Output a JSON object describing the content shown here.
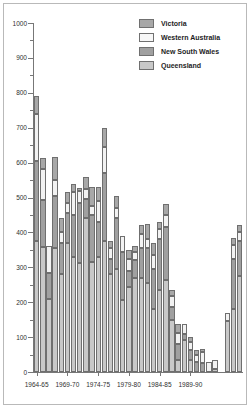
{
  "chart_data": {
    "type": "bar",
    "subtype": "stacked-vertical",
    "title": "",
    "xlabel": "",
    "ylabel": "",
    "ylim": [
      0,
      1000
    ],
    "ytick_step": 100,
    "yticks": [
      0,
      100,
      200,
      300,
      400,
      500,
      600,
      700,
      800,
      900,
      1000
    ],
    "ytick_labels": [
      "0",
      "100",
      "200",
      "300",
      "400",
      "500",
      "600",
      "700",
      "800",
      "900",
      "1000"
    ],
    "minor_ytick_step": 50,
    "grid": false,
    "legend_position": "top-right",
    "stack_order_bottom_to_top": [
      "Queensland",
      "New South Wales",
      "Western Australia",
      "Victoria"
    ],
    "series": [
      {
        "name": "Victoria",
        "color": "#a8a8a8",
        "values": [
          50,
          30,
          0,
          65,
          40,
          30,
          25,
          10,
          35,
          55,
          40,
          55,
          20,
          35,
          0,
          25,
          15,
          25,
          45,
          35,
          20,
          30,
          18,
          25,
          0,
          15,
          12,
          8,
          0,
          0,
          0,
          0,
          20,
          20
        ]
      },
      {
        "name": "Western Australia",
        "color": "#f2f2f2",
        "values": [
          135,
          90,
          78,
          45,
          30,
          30,
          65,
          35,
          30,
          25,
          60,
          75,
          30,
          30,
          45,
          35,
          25,
          40,
          25,
          40,
          30,
          35,
          32,
          33,
          28,
          22,
          20,
          33,
          30,
          25,
          0,
          23,
          40,
          25
        ]
      },
      {
        "name": "New South Wales",
        "color": "#a0a0a0",
        "values": [
          230,
          135,
          75,
          150,
          90,
          85,
          120,
          170,
          55,
          135,
          100,
          195,
          45,
          145,
          140,
          45,
          50,
          85,
          100,
          115,
          145,
          150,
          35,
          45,
          18,
          30,
          30,
          25,
          0,
          0,
          0,
          0,
          145,
          100
        ]
      },
      {
        "name": "Queensland",
        "color": "#c8c8c8",
        "values": [
          375,
          358,
          208,
          355,
          280,
          370,
          330,
          313,
          440,
          315,
          330,
          375,
          280,
          295,
          205,
          245,
          270,
          270,
          255,
          180,
          235,
          265,
          150,
          35,
          92,
          33,
          0,
          0,
          0,
          10,
          0,
          145,
          180,
          275
        ]
      }
    ],
    "categories": [
      "1964-65",
      "1965-66",
      "1966-67",
      "1967-68",
      "1968-69",
      "1969-70",
      "1970-71",
      "1971-72",
      "1972-73",
      "1973-74",
      "1974-75",
      "1975-76",
      "1976-77",
      "1977-78",
      "1978-79",
      "1979-80",
      "1980-81",
      "1981-82",
      "1982-83",
      "1983-84",
      "1984-85",
      "1985-86",
      "1986-87",
      "1987-88",
      "1988-89",
      "1989-90",
      "1990-91",
      "1991-92",
      "1992-93",
      "1993-94",
      "1994-95",
      "1995-96",
      "1996-97",
      "1997-98"
    ],
    "totals": [
      790,
      613,
      361,
      615,
      440,
      515,
      540,
      528,
      560,
      530,
      530,
      700,
      375,
      505,
      390,
      350,
      360,
      420,
      425,
      370,
      430,
      480,
      235,
      138,
      138,
      100,
      62,
      66,
      30,
      35,
      0,
      168,
      385,
      420
    ],
    "xtick_labels": [
      "1964-65",
      "1969-70",
      "1974-75",
      "1979-80",
      "1984-85",
      "1989-90"
    ],
    "xtick_category_indexes": [
      0,
      5,
      10,
      15,
      20,
      25
    ],
    "bar_count": 34,
    "bar_edge_color": "#6f6f6f"
  },
  "legend": {
    "items": [
      {
        "label": "Victoria",
        "swatch": "#a8a8a8"
      },
      {
        "label": "Western Australia",
        "swatch": "#f7f7f7"
      },
      {
        "label": "New South Wales",
        "swatch": "#a0a0a0"
      },
      {
        "label": "Queensland",
        "swatch": "#c8c8c8"
      }
    ]
  },
  "figure": {
    "background": "#ffffff",
    "frame_color": "#b9b9b9",
    "axis_color": "#777777",
    "tick_label_color": "#303030"
  }
}
